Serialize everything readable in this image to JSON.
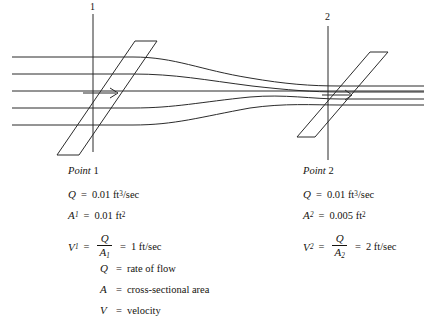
{
  "figure": {
    "type": "flow-continuity-diagram",
    "section_markers": [
      {
        "name": "section-marker-1",
        "label": "1",
        "x": 93,
        "y_top": 4,
        "y_bottom": 152
      },
      {
        "name": "section-marker-2",
        "label": "2",
        "x": 328,
        "y_top": 14,
        "y_bottom": 160
      }
    ],
    "planes": [
      {
        "name": "plane-1",
        "points": "135,41 157,41 79,155 57,155",
        "arrow": {
          "x1": 83,
          "y1": 93,
          "x2": 118,
          "y2": 93
        }
      },
      {
        "name": "plane-2",
        "points": "370,52 388,52 315,137 297,137",
        "arrow": {
          "x1": 322,
          "y1": 95,
          "x2": 352,
          "y2": 95
        }
      }
    ],
    "streamlines": [
      "M 12,57 L 133,57 C 175,57 200,70 250,78 C 285,84 310,86 340,86 L 424,86",
      "M 12,74 L 133,74 C 175,74 205,80 252,86 C 288,90 312,92 340,92 L 424,92",
      "M 12,91 L 424,91",
      "M 12,108 L 133,108 C 175,108 200,102 250,97 C 285,94 312,99 340,99 L 424,99",
      "M 12,125 L 133,125 C 175,125 200,117 250,108 C 285,103 312,105 340,105 L 424,105"
    ]
  },
  "point1": {
    "heading_italic": "Point",
    "heading_number": "1",
    "Q_symbol": "Q",
    "Q_equals": "=",
    "Q_value": "0.01 ft",
    "Q_exp": "3",
    "Q_unit": "/sec",
    "A_symbol": "A",
    "A_sub": "1",
    "A_equals": "=",
    "A_value": "0.01 ft",
    "A_exp": "2",
    "V_symbol": "V",
    "V_sub": "1",
    "V_equals": "=",
    "V_num": "Q",
    "V_den": "A",
    "V_den_sub": "1",
    "V_equals2": "=",
    "V_value": "1 ft/sec"
  },
  "point2": {
    "heading_italic": "Point",
    "heading_number": "2",
    "Q_symbol": "Q",
    "Q_equals": "=",
    "Q_value": "0.01 ft",
    "Q_exp": "3",
    "Q_unit": "/sec",
    "A_symbol": "A",
    "A_sub": "2",
    "A_equals": "=",
    "A_value": "0.005 ft",
    "A_exp": "2",
    "V_symbol": "V",
    "V_sub": "2",
    "V_equals": "=",
    "V_num": "Q",
    "V_den": "A",
    "V_den_sub": "2",
    "V_equals2": "=",
    "V_value": "2 ft/sec"
  },
  "definitions": [
    {
      "symbol": "Q",
      "equals": "=",
      "text": "rate of flow"
    },
    {
      "symbol": "A",
      "equals": "=",
      "text": "cross-sectional area"
    },
    {
      "symbol": "V",
      "equals": "=",
      "text": "velocity"
    }
  ],
  "colors": {
    "ink": "#16140f",
    "line": "#2b2b2b",
    "background": "#ffffff"
  }
}
